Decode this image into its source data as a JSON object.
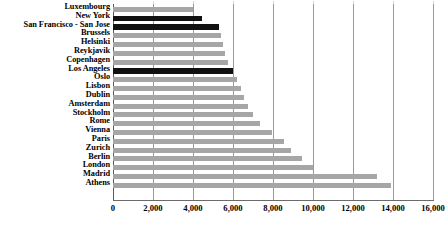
{
  "chart_data": {
    "type": "bar",
    "orientation": "horizontal",
    "title": "",
    "subtitle": "",
    "xlabel": "",
    "ylabel": "",
    "xlim": [
      0,
      16000
    ],
    "xticks": [
      0,
      2000,
      4000,
      6000,
      8000,
      10000,
      12000,
      14000,
      16000
    ],
    "xtick_labels": [
      "0",
      "2,000",
      "4,000",
      "6,000",
      "8,000",
      "10,000",
      "12,000",
      "14,000",
      "16,000"
    ],
    "grid": "vertical",
    "legend": "none",
    "categories": [
      "Luxembourg",
      "New York",
      "San Francisco - San Jose",
      "Brussels",
      "Helsinki",
      "Reykjavik",
      "Copenhagen",
      "Los Angeles",
      "Oslo",
      "Lisbon",
      "Dublin",
      "Amsterdam",
      "Stockholm",
      "Rome",
      "Vienna",
      "Paris",
      "Zurich",
      "Berlin",
      "London",
      "Madrid",
      "Athens"
    ],
    "values": [
      4000,
      4450,
      5300,
      5400,
      5500,
      5600,
      5750,
      6000,
      6200,
      6400,
      6550,
      6750,
      7000,
      7350,
      7950,
      8550,
      8900,
      9450,
      10000,
      13200,
      13900
    ],
    "highlight_categories": [
      "New York",
      "San Francisco - San Jose",
      "Los Angeles"
    ],
    "colors": {
      "bar": "#a6a6a6",
      "bar_highlight": "#111111",
      "gridline": "#9a9a9a",
      "axis": "#6b6b6b",
      "text": "#000000",
      "background": "#ffffff"
    }
  }
}
